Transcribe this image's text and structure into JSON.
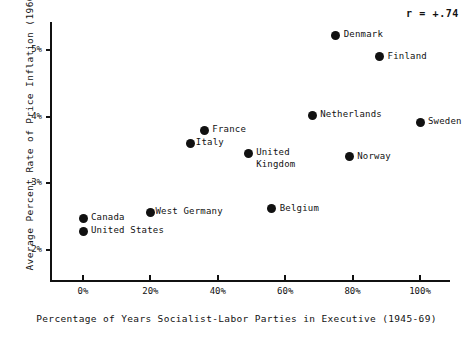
{
  "chart_data": {
    "type": "scatter",
    "title": "",
    "xlabel": "Percentage of Years Socialist-Labor Parties in Executive (1945-69)",
    "ylabel": "Average Percent Rate of Price Inflation (1960-69)",
    "xlim": [
      0,
      100
    ],
    "ylim": [
      2,
      5.5
    ],
    "grid": false,
    "legend": "none",
    "annotation": "r = +.74",
    "xticks": [
      "0%",
      "20%",
      "40%",
      "60%",
      "80%",
      "100%"
    ],
    "xtick_values": [
      0,
      20,
      40,
      60,
      80,
      100
    ],
    "yticks": [
      "2%",
      "3%",
      "4%",
      "5%"
    ],
    "ytick_values": [
      2,
      3,
      4,
      5
    ],
    "points": [
      {
        "label": "Denmark",
        "x": 75,
        "y": 5.22,
        "label_pos": "right"
      },
      {
        "label": "Finland",
        "x": 88,
        "y": 4.9,
        "label_pos": "right"
      },
      {
        "label": "Netherlands",
        "x": 68,
        "y": 4.02,
        "label_pos": "right"
      },
      {
        "label": "Sweden",
        "x": 100,
        "y": 3.92,
        "label_pos": "right"
      },
      {
        "label": "France",
        "x": 36,
        "y": 3.8,
        "label_pos": "right"
      },
      {
        "label": "Italy",
        "x": 32,
        "y": 3.6,
        "label_pos": "right-tight"
      },
      {
        "label": "United\nKingdom",
        "x": 49,
        "y": 3.45,
        "label_pos": "right"
      },
      {
        "label": "Norway",
        "x": 79,
        "y": 3.4,
        "label_pos": "right"
      },
      {
        "label": "Belgium",
        "x": 56,
        "y": 2.62,
        "label_pos": "right"
      },
      {
        "label": "West Germany",
        "x": 20,
        "y": 2.57,
        "label_pos": "right-tight"
      },
      {
        "label": "Canada",
        "x": 0,
        "y": 2.48,
        "label_pos": "right"
      },
      {
        "label": "United States",
        "x": 0,
        "y": 2.28,
        "label_pos": "right"
      }
    ]
  },
  "axes": {
    "x_title": "Percentage of Years Socialist-Labor Parties in Executive (1945-69)",
    "y_title": "Average Percent Rate of Price Inflation (1960-69)"
  },
  "annotation": {
    "correlation": "r = +.74"
  }
}
